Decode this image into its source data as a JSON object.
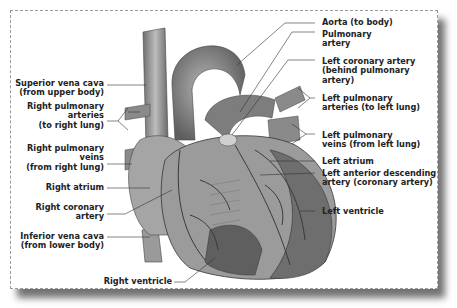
{
  "diagram": {
    "labels_left": [
      {
        "id": "superior-vena-cava",
        "text": "Superior vena cava\n(from upper body)"
      },
      {
        "id": "right-pulmonary-arteries",
        "text": "Right pulmonary\narteries\n(to right lung)"
      },
      {
        "id": "right-pulmonary-veins",
        "text": "Right pulmonary\nveins\n(from right lung)"
      },
      {
        "id": "right-atrium",
        "text": "Right atrium"
      },
      {
        "id": "right-coronary-artery",
        "text": "Right coronary\nartery"
      },
      {
        "id": "inferior-vena-cava",
        "text": "Inferior vena cava\n(from lower body)"
      }
    ],
    "labels_bottom": [
      {
        "id": "right-ventricle",
        "text": "Right ventricle"
      }
    ],
    "labels_right": [
      {
        "id": "aorta",
        "text": "Aorta (to body)"
      },
      {
        "id": "pulmonary-artery",
        "text": "Pulmonary\nartery"
      },
      {
        "id": "left-coronary-artery",
        "text": "Left coronary artery\n(behind pulmonary\nartery)"
      },
      {
        "id": "left-pulmonary-arteries",
        "text": "Left pulmonary\narteries (to left lung)"
      },
      {
        "id": "left-pulmonary-veins",
        "text": "Left pulmonary\nveins (from left lung)"
      },
      {
        "id": "left-atrium",
        "text": "Left atrium"
      },
      {
        "id": "left-anterior-descending-artery",
        "text": "Left anterior descending\nartery (coronary artery)"
      },
      {
        "id": "left-ventricle",
        "text": "Left ventricle"
      }
    ],
    "colors": {
      "heart_dark": "#5a5a5a",
      "heart_mid": "#8c8c8c",
      "heart_light": "#b9b9b9",
      "vessel": "#7a7a7a",
      "leader": "#333333"
    }
  }
}
